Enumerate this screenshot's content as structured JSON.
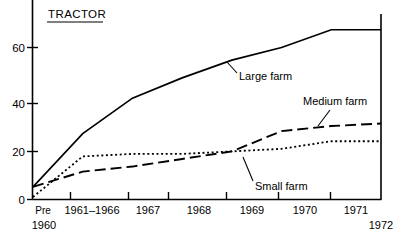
{
  "chart_data": {
    "type": "line",
    "title": "TRACTOR",
    "xlabel": "",
    "ylabel": "",
    "ylim": [
      0,
      72
    ],
    "yticks": [
      0,
      20,
      40,
      60
    ],
    "ytick_labels": [
      "0",
      "20",
      "40",
      "60"
    ],
    "grid": false,
    "legend_position": "inline-annotations",
    "categories": [
      "Pre 1960",
      "1961-1966",
      "1967",
      "1968",
      "1969",
      "1970",
      "1971",
      "1972"
    ],
    "x_tick_labels": [
      {
        "line1": "Pre",
        "line2": "1960"
      },
      {
        "line1": "1961–1966",
        "line2": ""
      },
      {
        "line1": "1967",
        "line2": ""
      },
      {
        "line1": "1968",
        "line2": ""
      },
      {
        "line1": "1969",
        "line2": ""
      },
      {
        "line1": "1970",
        "line2": ""
      },
      {
        "line1": "1971",
        "line2": ""
      },
      {
        "line1": "1972",
        "line2": ""
      }
    ],
    "series": [
      {
        "name": "Large farm",
        "style": "solid",
        "values": [
          5,
          26,
          40,
          48,
          55,
          60,
          67,
          67
        ]
      },
      {
        "name": "Medium farm",
        "style": "dashed",
        "values": [
          5,
          11,
          13,
          16,
          19,
          27,
          29,
          30
        ]
      },
      {
        "name": "Small farm",
        "style": "dotted",
        "values": [
          1,
          17,
          18,
          18,
          19,
          20,
          23,
          23
        ]
      }
    ],
    "annotations": [
      {
        "text": "Large farm",
        "series": "Large farm"
      },
      {
        "text": "Medium farm",
        "series": "Medium farm"
      },
      {
        "text": "Small farm",
        "series": "Small farm"
      }
    ]
  }
}
